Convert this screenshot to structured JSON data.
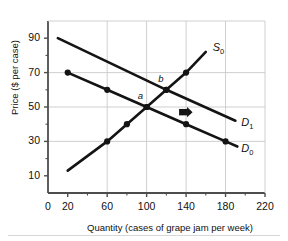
{
  "chart_data": {
    "type": "line",
    "title": "",
    "xlabel": "Quantity (cases of grape jam per week)",
    "ylabel": "Price ($ per case)",
    "xlim": [
      0,
      220
    ],
    "ylim": [
      0,
      100
    ],
    "xticks": [
      0,
      20,
      60,
      100,
      140,
      180,
      220
    ],
    "yticks": [
      10,
      30,
      50,
      70,
      90
    ],
    "xminorticks": [
      40,
      80,
      120,
      160,
      200
    ],
    "yminorticks": [
      20,
      40,
      60,
      80
    ],
    "grid": "major gridlines at x = 60, 100, 140, 180 and y = 30, 50, 70",
    "legend": "inline curve labels at line ends",
    "series": [
      {
        "name": "S0",
        "label": "S",
        "subscript": "0",
        "kind": "supply",
        "points": [
          {
            "x": 20,
            "y": 13,
            "marker": false
          },
          {
            "x": 60,
            "y": 30,
            "marker": true
          },
          {
            "x": 80,
            "y": 40,
            "marker": true
          },
          {
            "x": 100,
            "y": 50,
            "marker": true
          },
          {
            "x": 120,
            "y": 60,
            "marker": true
          },
          {
            "x": 140,
            "y": 70,
            "marker": true
          },
          {
            "x": 160,
            "y": 82,
            "marker": false
          }
        ],
        "label_at": {
          "x": 167,
          "y": 84
        }
      },
      {
        "name": "D1",
        "label": "D",
        "subscript": "1",
        "kind": "demand",
        "points": [
          {
            "x": 10,
            "y": 90,
            "marker": false
          },
          {
            "x": 120,
            "y": 60,
            "marker": true
          },
          {
            "x": 190,
            "y": 42,
            "marker": false
          }
        ],
        "label_at": {
          "x": 196,
          "y": 40
        }
      },
      {
        "name": "D0",
        "label": "D",
        "subscript": "0",
        "kind": "demand",
        "points": [
          {
            "x": 20,
            "y": 70,
            "marker": true
          },
          {
            "x": 60,
            "y": 60,
            "marker": true
          },
          {
            "x": 100,
            "y": 50,
            "marker": true
          },
          {
            "x": 140,
            "y": 40,
            "marker": true
          },
          {
            "x": 180,
            "y": 30,
            "marker": true
          },
          {
            "x": 192,
            "y": 27,
            "marker": false
          }
        ],
        "label_at": {
          "x": 196,
          "y": 25
        }
      }
    ],
    "annotations": [
      {
        "text": "a",
        "x": 100,
        "y": 50,
        "role": "equilibrium-point",
        "offset_x": -9,
        "offset_y": 9
      },
      {
        "text": "b",
        "x": 120,
        "y": 60,
        "role": "equilibrium-point",
        "offset_x": -8,
        "offset_y": 9
      },
      {
        "text": "shift-arrow",
        "x": 140,
        "y": 47,
        "role": "demand-shift-arrow",
        "direction": "right"
      }
    ]
  },
  "axes": {
    "y_title": "Price ($ per case)",
    "x_title": "Quantity (cases of grape jam per week)",
    "y_tick_labels": [
      "90",
      "70",
      "50",
      "30",
      "10"
    ],
    "x_tick_labels": [
      "0",
      "20",
      "60",
      "100",
      "140",
      "180",
      "220"
    ]
  },
  "labels": {
    "s0_letter": "S",
    "s0_sub": "0",
    "d1_letter": "D",
    "d1_sub": "1",
    "d0_letter": "D",
    "d0_sub": "0",
    "point_a": "a",
    "point_b": "b"
  },
  "colors": {
    "curve": "#141414",
    "grid": "#c9c9c9",
    "axis": "#4d4d4d",
    "text": "#111111",
    "background": "#ffffff",
    "footrule": "#d8d8d8"
  }
}
